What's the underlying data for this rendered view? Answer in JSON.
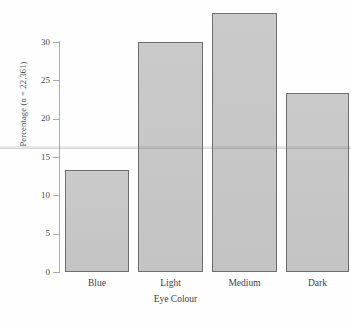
{
  "chart_data": {
    "type": "bar",
    "title": "",
    "subtitle": "",
    "xlabel": "Eye Colour",
    "ylabel": "Percentage (n = 22,361)",
    "ylabel_prefix": "Percentage (",
    "ylabel_italic": "n",
    "ylabel_suffix": " = 22,361)",
    "categories": [
      "Blue",
      "Light",
      "Medium",
      "Dark"
    ],
    "values": [
      13.3,
      30.0,
      33.8,
      23.3
    ],
    "ylim": [
      0,
      35
    ],
    "ytick_values": [
      0,
      5,
      10,
      15,
      20,
      25,
      30
    ],
    "ytick_labels": [
      "0",
      "5",
      "10",
      "15",
      "20",
      "25",
      "30"
    ],
    "xtick_labels": [
      "Blue",
      "Light",
      "Medium",
      "Dark"
    ],
    "grid": false,
    "legend": null,
    "legend_position": "none",
    "bar_fill_color": "#c9c9c9",
    "bar_edge_color": "#6d6d6d",
    "axis_color": "#adadad",
    "text_color": "#3f3f3f",
    "background_color": "#ffffff",
    "annotations": []
  },
  "axes": {
    "y_axis_name": "y-axis",
    "x_axis_name": "x-axis"
  }
}
